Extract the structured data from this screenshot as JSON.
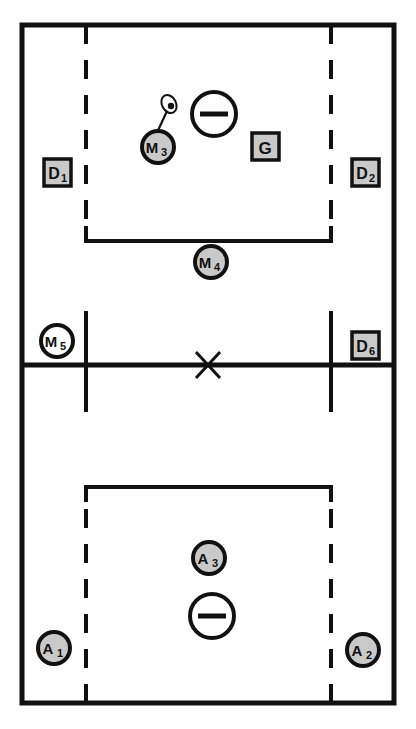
{
  "diagram": {
    "title": "",
    "sport": "lacrosse",
    "colors": {
      "line": "#111111",
      "field": "#ffffff",
      "marker_fill": "#c9c9c9",
      "marker_stroke": "#111111",
      "badge_fill": "#c9c9c9",
      "badge_stroke": "#111111",
      "goal_fill": "#ffffff"
    },
    "field": {
      "boundary": {
        "x": 22,
        "y": 25,
        "width": 372,
        "height": 678
      },
      "midline_y": 365,
      "center_x_mark": {
        "x": 208,
        "y": 365,
        "size": 18
      },
      "wing_lines": [
        {
          "name": "left-wing-line",
          "x": 86,
          "y1": 311,
          "y2": 412
        },
        {
          "name": "right-wing-line",
          "x": 331,
          "y1": 311,
          "y2": 412
        }
      ],
      "attack_boxes": [
        {
          "name": "top-attack-box",
          "x1": 86,
          "x2": 331,
          "y_open": 25,
          "y_closed": 241
        },
        {
          "name": "bottom-attack-box",
          "x1": 86,
          "x2": 331,
          "y_open": 703,
          "y_closed": 487
        }
      ]
    },
    "goals": [
      {
        "name": "top-goal-crease",
        "cx": 214,
        "cy": 114,
        "r": 22
      },
      {
        "name": "bottom-goal-crease",
        "cx": 212,
        "cy": 616,
        "r": 22
      }
    ],
    "circle_markers": [
      {
        "id": "M3",
        "letter": "M",
        "number": "3",
        "cx": 158,
        "cy": 147,
        "r": 16,
        "has_stick": true
      },
      {
        "id": "M4",
        "letter": "M",
        "number": "4",
        "cx": 211,
        "cy": 262,
        "r": 16,
        "has_stick": false
      },
      {
        "id": "M5",
        "letter": "M",
        "number": "5",
        "cx": 57,
        "cy": 341,
        "r": 16,
        "has_stick": false
      },
      {
        "id": "A3",
        "letter": "A",
        "number": "3",
        "cx": 209,
        "cy": 558,
        "r": 16,
        "has_stick": false
      },
      {
        "id": "A1",
        "letter": "A",
        "number": "1",
        "cx": 54,
        "cy": 648,
        "r": 16,
        "has_stick": false
      },
      {
        "id": "A2",
        "letter": "A",
        "number": "2",
        "cx": 363,
        "cy": 650,
        "r": 16,
        "has_stick": false
      }
    ],
    "square_markers": [
      {
        "id": "D1",
        "letter": "D",
        "number": "1",
        "x": 44,
        "y": 159,
        "size": 27
      },
      {
        "id": "D2",
        "letter": "D",
        "number": "2",
        "x": 352,
        "y": 159,
        "size": 27
      },
      {
        "id": "G",
        "letter": "G",
        "number": "",
        "x": 252,
        "y": 133,
        "size": 27
      },
      {
        "id": "D6",
        "letter": "D",
        "number": "6",
        "x": 352,
        "y": 332,
        "size": 27
      }
    ],
    "stick": {
      "name": "lacrosse-stick-with-ball",
      "shaft": {
        "x1": 156,
        "y1": 136,
        "x2": 168,
        "y2": 110
      },
      "head": {
        "cx": 170,
        "cy": 103,
        "rx": 7,
        "ry": 9,
        "rotation": -25
      },
      "ball": {
        "cx": 172,
        "cy": 105,
        "r": 3
      }
    },
    "legend": {
      "circle_meaning": "midfielder / attacker player marker",
      "square_meaning": "defender / goalie player marker",
      "goal_meaning": "goal and crease"
    }
  }
}
